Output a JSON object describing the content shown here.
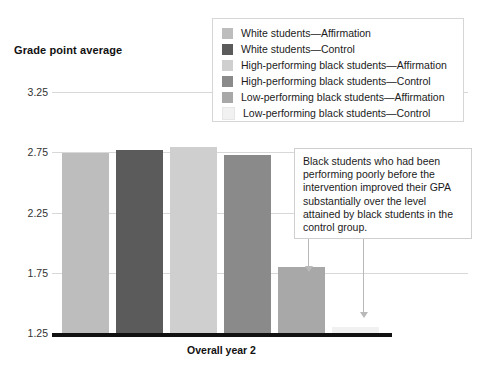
{
  "chart_data": {
    "type": "bar",
    "title": "",
    "ylabel": "Grade point average",
    "xlabel": "Overall year 2",
    "ylim": [
      1.25,
      3.25
    ],
    "ytick_labels": [
      "3.25",
      "2.75",
      "2.25",
      "1.75",
      "1.25"
    ],
    "ytick_values": [
      3.25,
      2.75,
      2.25,
      1.75,
      1.25
    ],
    "grid": true,
    "legend_position": "top-right",
    "categories": [
      "Overall year 2"
    ],
    "bars": [
      {
        "label": "White students—Affirmation",
        "value": 2.74,
        "color": "#bdbdbd"
      },
      {
        "label": "White students—Control",
        "value": 2.77,
        "color": "#5b5b5b"
      },
      {
        "label": "High-performing black students—Affirmation",
        "value": 2.79,
        "color": "#cfcfcf"
      },
      {
        "label": "High-performing black students—Control",
        "value": 2.73,
        "color": "#8a8a8a"
      },
      {
        "label": "Low-performing black students—Affirmation",
        "value": 1.8,
        "color": "#a8a8a8"
      },
      {
        "label": "Low-performing black students—Control",
        "value": 1.3,
        "color": "#f1f1f1"
      }
    ],
    "annotations": [
      {
        "text": "Black students who had been performing poorly before the intervention improved their GPA substantially over the level attained by black students in the control group.",
        "points_to": [
          "Low-performing black students—Affirmation",
          "Low-performing black students—Control"
        ]
      }
    ]
  },
  "legend": {
    "items": [
      {
        "label": "White students—Affirmation",
        "color": "#bdbdbd"
      },
      {
        "label": "White students—Control",
        "color": "#5b5b5b"
      },
      {
        "label": "High-performing black students—Affirmation",
        "color": "#cfcfcf"
      },
      {
        "label": "High-performing black students—Control",
        "color": "#8a8a8a"
      },
      {
        "label": "Low-performing black students—Affirmation",
        "color": "#a8a8a8"
      },
      {
        "label": "Low-performing black students—Control",
        "color": "#f1f1f1"
      }
    ]
  },
  "axes": {
    "y_title": "Grade point average",
    "x_title": "Overall year 2"
  },
  "annotation": {
    "text": "Black students who had been performing poorly before the intervention improved their GPA substantially over the level attained by black students in the control group."
  }
}
